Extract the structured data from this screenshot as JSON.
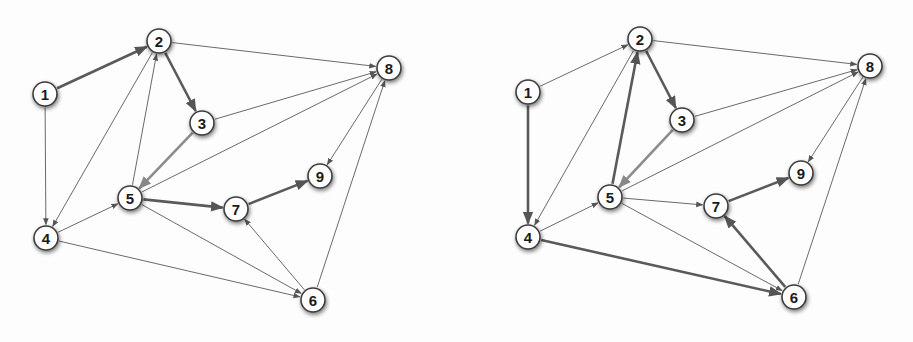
{
  "figure": {
    "colors": {
      "background": "#fdfdfd",
      "node_fill": "#ffffff",
      "node_stroke": "#3c3c3c",
      "thin_edge": "#6a6a6a",
      "thick_edge": "#5a5a5a",
      "thick_edge_light": "#8c8c8c"
    }
  },
  "graphs": [
    {
      "name": "left-graph",
      "nodes": [
        {
          "id": "1",
          "label": "1",
          "x": 45,
          "y": 94
        },
        {
          "id": "2",
          "label": "2",
          "x": 159,
          "y": 41
        },
        {
          "id": "3",
          "label": "3",
          "x": 202,
          "y": 123
        },
        {
          "id": "4",
          "label": "4",
          "x": 46,
          "y": 238
        },
        {
          "id": "5",
          "label": "5",
          "x": 130,
          "y": 198
        },
        {
          "id": "6",
          "label": "6",
          "x": 313,
          "y": 300
        },
        {
          "id": "7",
          "label": "7",
          "x": 236,
          "y": 209
        },
        {
          "id": "8",
          "label": "8",
          "x": 389,
          "y": 68
        },
        {
          "id": "9",
          "label": "9",
          "x": 320,
          "y": 176
        }
      ],
      "edges": [
        {
          "from": "1",
          "to": "2",
          "style": "thick"
        },
        {
          "from": "1",
          "to": "4",
          "style": "thin"
        },
        {
          "from": "2",
          "to": "3",
          "style": "thick"
        },
        {
          "from": "2",
          "to": "8",
          "style": "thin"
        },
        {
          "from": "2",
          "to": "4",
          "style": "thin"
        },
        {
          "from": "5",
          "to": "2",
          "style": "thin"
        },
        {
          "from": "3",
          "to": "8",
          "style": "thin"
        },
        {
          "from": "3",
          "to": "5",
          "style": "thick-light"
        },
        {
          "from": "5",
          "to": "8",
          "style": "thin"
        },
        {
          "from": "8",
          "to": "9",
          "style": "thin"
        },
        {
          "from": "4",
          "to": "5",
          "style": "thin"
        },
        {
          "from": "4",
          "to": "6",
          "style": "thin"
        },
        {
          "from": "5",
          "to": "7",
          "style": "thick"
        },
        {
          "from": "5",
          "to": "6",
          "style": "thin"
        },
        {
          "from": "7",
          "to": "9",
          "style": "thick"
        },
        {
          "from": "6",
          "to": "7",
          "style": "thin"
        },
        {
          "from": "6",
          "to": "8",
          "style": "thin"
        }
      ]
    },
    {
      "name": "right-graph",
      "nodes": [
        {
          "id": "1",
          "label": "1",
          "x": 528,
          "y": 92
        },
        {
          "id": "2",
          "label": "2",
          "x": 640,
          "y": 39
        },
        {
          "id": "3",
          "label": "3",
          "x": 682,
          "y": 120
        },
        {
          "id": "4",
          "label": "4",
          "x": 528,
          "y": 237
        },
        {
          "id": "5",
          "label": "5",
          "x": 610,
          "y": 197
        },
        {
          "id": "6",
          "label": "6",
          "x": 794,
          "y": 297
        },
        {
          "id": "7",
          "label": "7",
          "x": 716,
          "y": 206
        },
        {
          "id": "8",
          "label": "8",
          "x": 870,
          "y": 66
        },
        {
          "id": "9",
          "label": "9",
          "x": 801,
          "y": 173
        }
      ],
      "edges": [
        {
          "from": "1",
          "to": "2",
          "style": "thin"
        },
        {
          "from": "1",
          "to": "4",
          "style": "thick"
        },
        {
          "from": "2",
          "to": "3",
          "style": "thick"
        },
        {
          "from": "2",
          "to": "8",
          "style": "thin"
        },
        {
          "from": "2",
          "to": "4",
          "style": "thin"
        },
        {
          "from": "5",
          "to": "2",
          "style": "thick"
        },
        {
          "from": "3",
          "to": "8",
          "style": "thin"
        },
        {
          "from": "3",
          "to": "5",
          "style": "thick-light"
        },
        {
          "from": "5",
          "to": "8",
          "style": "thin"
        },
        {
          "from": "8",
          "to": "9",
          "style": "thin"
        },
        {
          "from": "4",
          "to": "5",
          "style": "thin"
        },
        {
          "from": "4",
          "to": "6",
          "style": "thick"
        },
        {
          "from": "5",
          "to": "7",
          "style": "thin"
        },
        {
          "from": "5",
          "to": "6",
          "style": "thin"
        },
        {
          "from": "7",
          "to": "9",
          "style": "thick"
        },
        {
          "from": "6",
          "to": "7",
          "style": "thick"
        },
        {
          "from": "6",
          "to": "8",
          "style": "thin"
        }
      ]
    }
  ]
}
